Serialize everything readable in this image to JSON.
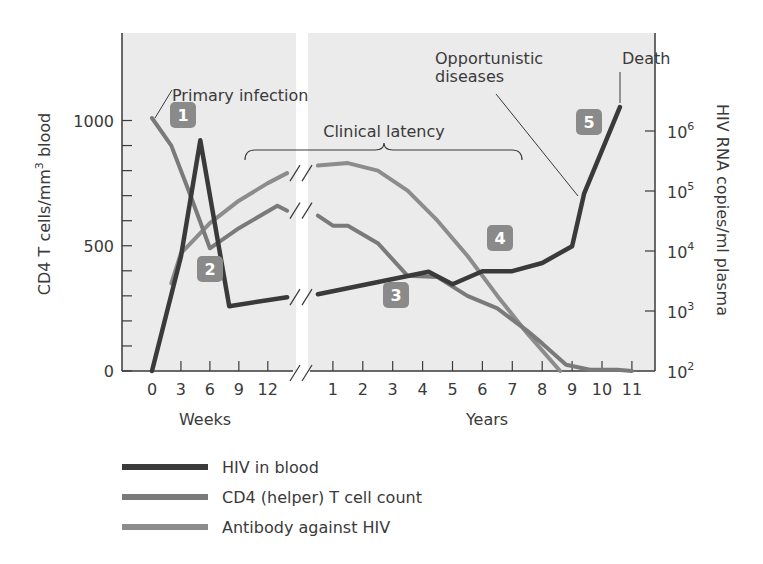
{
  "chart_data": {
    "type": "line",
    "title": "",
    "left_axis": {
      "label": "CD4 T cells/mm³ blood",
      "label_parts": [
        "CD4 T cells/mm",
        "3",
        " blood"
      ],
      "ticks": [
        0,
        500,
        1000
      ],
      "minor_step": 100,
      "range": [
        0,
        1300
      ]
    },
    "right_axis": {
      "label": "HIV RNA copies/ml plasma",
      "ticks": [
        {
          "base": "10",
          "exp": "2"
        },
        {
          "base": "10",
          "exp": "3"
        },
        {
          "base": "10",
          "exp": "4"
        },
        {
          "base": "10",
          "exp": "5"
        },
        {
          "base": "10",
          "exp": "6"
        }
      ],
      "scale": "log",
      "range": [
        100,
        10000000
      ]
    },
    "x_axis": {
      "segments": [
        {
          "label": "Weeks",
          "ticks": [
            "0",
            "3",
            "6",
            "9",
            "12"
          ]
        },
        {
          "label": "Years",
          "ticks": [
            "1",
            "2",
            "3",
            "4",
            "5",
            "6",
            "7",
            "8",
            "9",
            "10",
            "11"
          ]
        }
      ],
      "break_between_segments": true
    },
    "series": [
      {
        "name": "HIV in blood",
        "axis": "right",
        "color": "#3a3a3a",
        "points": [
          {
            "seg": "weeks",
            "x": 0,
            "y": 100
          },
          {
            "seg": "weeks",
            "x": 3,
            "y": 8000
          },
          {
            "seg": "weeks",
            "x": 5,
            "y": 700000
          },
          {
            "seg": "weeks",
            "x": 8,
            "y": 1200
          },
          {
            "seg": "weeks",
            "x": 14,
            "y": 1700
          },
          {
            "seg": "years",
            "x": 0.5,
            "y": 1900
          },
          {
            "seg": "years",
            "x": 4.2,
            "y": 4500
          },
          {
            "seg": "years",
            "x": 5,
            "y": 2800
          },
          {
            "seg": "years",
            "x": 6,
            "y": 4600
          },
          {
            "seg": "years",
            "x": 7,
            "y": 4600
          },
          {
            "seg": "years",
            "x": 8,
            "y": 6300
          },
          {
            "seg": "years",
            "x": 9,
            "y": 12000
          },
          {
            "seg": "years",
            "x": 9.4,
            "y": 90000
          },
          {
            "seg": "years",
            "x": 10.6,
            "y": 2500000
          }
        ]
      },
      {
        "name": "CD4 (helper) T cell count",
        "axis": "left",
        "color": "#7a7a7a",
        "points": [
          {
            "seg": "weeks",
            "x": 0,
            "y": 1010
          },
          {
            "seg": "weeks",
            "x": 2,
            "y": 900
          },
          {
            "seg": "weeks",
            "x": 4,
            "y": 700
          },
          {
            "seg": "weeks",
            "x": 6,
            "y": 490
          },
          {
            "seg": "weeks",
            "x": 9,
            "y": 570
          },
          {
            "seg": "weeks",
            "x": 13,
            "y": 660
          },
          {
            "seg": "weeks",
            "x": 14,
            "y": 640
          },
          {
            "seg": "years",
            "x": 0.5,
            "y": 620
          },
          {
            "seg": "years",
            "x": 1,
            "y": 580
          },
          {
            "seg": "years",
            "x": 1.5,
            "y": 580
          },
          {
            "seg": "years",
            "x": 2.5,
            "y": 510
          },
          {
            "seg": "years",
            "x": 3.5,
            "y": 380
          },
          {
            "seg": "years",
            "x": 4.5,
            "y": 375
          },
          {
            "seg": "years",
            "x": 5.5,
            "y": 300
          },
          {
            "seg": "years",
            "x": 6.5,
            "y": 250
          },
          {
            "seg": "years",
            "x": 7.5,
            "y": 160
          },
          {
            "seg": "years",
            "x": 8,
            "y": 110
          },
          {
            "seg": "years",
            "x": 8.8,
            "y": 25
          },
          {
            "seg": "years",
            "x": 9.6,
            "y": 5
          },
          {
            "seg": "years",
            "x": 10.5,
            "y": 5
          },
          {
            "seg": "years",
            "x": 11,
            "y": 0
          }
        ]
      },
      {
        "name": "Antibody against HIV",
        "axis": "left",
        "color": "#8c8c8c",
        "points": [
          {
            "seg": "weeks",
            "x": 2,
            "y": 350
          },
          {
            "seg": "weeks",
            "x": 3,
            "y": 470
          },
          {
            "seg": "weeks",
            "x": 6,
            "y": 590
          },
          {
            "seg": "weeks",
            "x": 9,
            "y": 680
          },
          {
            "seg": "weeks",
            "x": 12,
            "y": 750
          },
          {
            "seg": "weeks",
            "x": 14,
            "y": 790
          },
          {
            "seg": "years",
            "x": 0.5,
            "y": 820
          },
          {
            "seg": "years",
            "x": 1.5,
            "y": 830
          },
          {
            "seg": "years",
            "x": 2.5,
            "y": 800
          },
          {
            "seg": "years",
            "x": 3.5,
            "y": 720
          },
          {
            "seg": "years",
            "x": 4.5,
            "y": 600
          },
          {
            "seg": "years",
            "x": 5.5,
            "y": 460
          },
          {
            "seg": "years",
            "x": 6.5,
            "y": 300
          },
          {
            "seg": "years",
            "x": 7.5,
            "y": 150
          },
          {
            "seg": "years",
            "x": 8.6,
            "y": 0
          }
        ]
      }
    ],
    "annotations": [
      {
        "id": "primary",
        "text": "Primary infection"
      },
      {
        "id": "latency",
        "text": "Clinical latency"
      },
      {
        "id": "opportunistic",
        "text": "Opportunistic diseases",
        "lines": [
          "Opportunistic",
          "diseases"
        ]
      },
      {
        "id": "death",
        "text": "Death"
      }
    ],
    "badges": [
      "1",
      "2",
      "3",
      "4",
      "5"
    ],
    "grid": false,
    "legend_position": "bottom-left"
  },
  "legend": [
    {
      "label": "HIV in blood",
      "color": "#3a3a3a"
    },
    {
      "label": "CD4 (helper) T cell count",
      "color": "#7a7a7a"
    },
    {
      "label": "Antibody against HIV",
      "color": "#8c8c8c"
    }
  ],
  "colors": {
    "plot_bg": "#ebebeb",
    "axis": "#3a3a3a",
    "badge": "#8a8a8a"
  }
}
